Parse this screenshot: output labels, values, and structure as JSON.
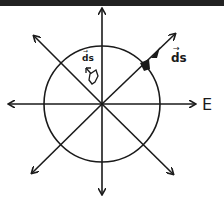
{
  "diagram": {
    "type": "electric-field-flux-diagram",
    "field_label": "E",
    "vector_label_outer": "ds",
    "vector_label_inner": "ds",
    "vector_arrow_mark": "→",
    "elements": {
      "circle": "gaussian-surface",
      "field_lines": 8,
      "center": [
        102,
        104
      ],
      "radius": 58
    },
    "colors": {
      "ink": "#1a1a1a",
      "background": "#ffffff",
      "top_bar": "#222222"
    }
  }
}
